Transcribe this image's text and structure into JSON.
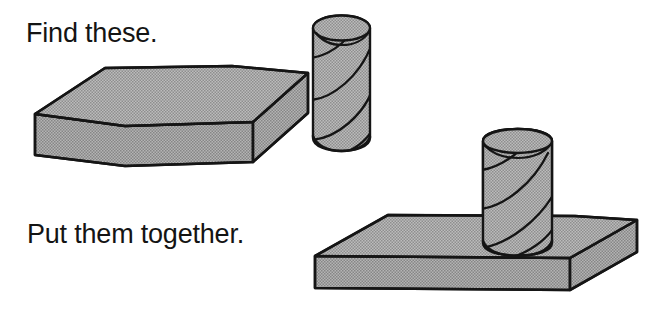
{
  "page": {
    "title": "Find these. Put them together.",
    "background_color": "#ffffff",
    "width": 668,
    "height": 310,
    "style": "line drawing with halftone gray fill"
  },
  "captions": {
    "find": "Find these.",
    "together": "Put them together."
  },
  "colors": {
    "background": "#ffffff",
    "ink": "#151515",
    "fill_gray": "#a9a9a9",
    "fill_gray_top": "#adadad",
    "fill_gray_front": "#a4a4a4",
    "text": "#141414"
  },
  "objects": [
    {
      "id": "slab-separate",
      "name": "rectangular slab",
      "group": "find-these",
      "description": "thick rectangular block drawn in isometric view, top face and front face visible"
    },
    {
      "id": "cylinder-separate",
      "name": "spiral cylinder",
      "group": "find-these",
      "description": "upright cylinder with helical spiral stripe lines on its curved surface"
    },
    {
      "id": "slab-assembled",
      "name": "rectangular slab",
      "group": "put-them-together",
      "description": "thinner rectangular block drawn in isometric view serving as a base"
    },
    {
      "id": "cylinder-assembled",
      "name": "spiral cylinder",
      "group": "put-them-together",
      "description": "upright spiral cylinder standing on and inserted into the slab"
    }
  ],
  "icons": {
    "slab": "cuboid-slab-icon",
    "cylinder": "spiral-cylinder-icon"
  }
}
